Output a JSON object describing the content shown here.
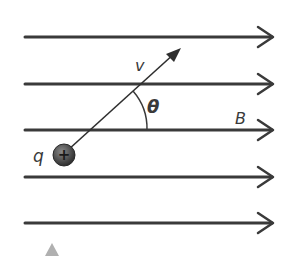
{
  "diagram": {
    "labels": {
      "velocity": "v",
      "angle": "θ",
      "field": "B",
      "charge": "q",
      "charge_sign": "+"
    },
    "field_lines": [
      {
        "y": 37
      },
      {
        "y": 84
      },
      {
        "y": 130
      },
      {
        "y": 177
      },
      {
        "y": 223
      }
    ],
    "colors": {
      "line": "#3a3a3a",
      "charge_fill": "#555555",
      "marker": "#b0b0b0"
    }
  }
}
